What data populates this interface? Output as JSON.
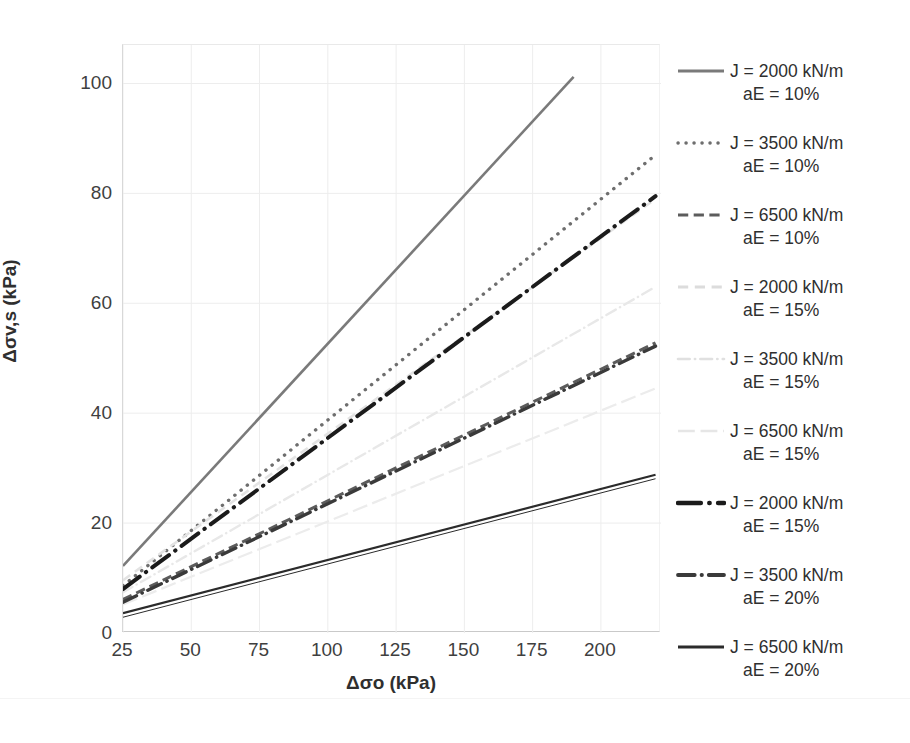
{
  "chart_data": {
    "type": "line",
    "title": "",
    "xlabel": "Δσo (kPa)",
    "ylabel": "Δσv,s (kPa)",
    "xlim": [
      25,
      222
    ],
    "ylim": [
      0,
      107
    ],
    "xticks": [
      25,
      50,
      75,
      100,
      125,
      150,
      175,
      200
    ],
    "yticks": [
      0,
      20,
      40,
      60,
      80,
      100
    ],
    "grid": true,
    "legend_position": "right",
    "series": [
      {
        "name": "J = 2000 kN/m aE = 10%",
        "J": 2000,
        "aE": "10%",
        "style": "solid",
        "color": "#7a7a7a",
        "width": 2.6,
        "x": [
          25,
          190
        ],
        "y": [
          12.2,
          101.2
        ]
      },
      {
        "name": "J = 3500 kN/m aE = 10%",
        "J": 3500,
        "aE": "10%",
        "style": "dotted",
        "color": "#6e6e6e",
        "width": 3.4,
        "x": [
          25,
          220
        ],
        "y": [
          8.6,
          87.0
        ]
      },
      {
        "name": "J = 6500 kN/m aE = 10%",
        "J": 6500,
        "aE": "10%",
        "style": "dashed",
        "color": "#5c5c5c",
        "width": 3.0,
        "x": [
          25,
          220
        ],
        "y": [
          6.1,
          52.8
        ]
      },
      {
        "name": "J = 2000 kN/m aE = 15%",
        "J": 2000,
        "aE": "15%",
        "style": "dashed-light",
        "color": "#e3e3e3",
        "width": 2.6,
        "x": [
          25,
          220
        ],
        "y": [
          9.6,
          79.0
        ]
      },
      {
        "name": "J = 3500 kN/m aE = 15%",
        "J": 3500,
        "aE": "15%",
        "style": "dash-dot-light",
        "color": "#e8e8e8",
        "width": 2.4,
        "x": [
          25,
          220
        ],
        "y": [
          7.4,
          63.0
        ]
      },
      {
        "name": "J = 6500 kN/m aE = 15%",
        "J": 6500,
        "aE": "15%",
        "style": "long-dash-light",
        "color": "#ececec",
        "width": 2.2,
        "x": [
          25,
          220
        ],
        "y": [
          5.2,
          44.5
        ]
      },
      {
        "name": "J = 2000 kN/m aE = 15%",
        "J": 2000,
        "aE": "15%",
        "style": "dash-dot-bold",
        "color": "#1b1b1b",
        "width": 4.0,
        "x": [
          25,
          220
        ],
        "y": [
          8.0,
          79.5
        ]
      },
      {
        "name": "J = 3500 kN/m aE = 20%",
        "J": 3500,
        "aE": "20%",
        "style": "dash-dot-mid",
        "color": "#3a3a3a",
        "width": 3.4,
        "x": [
          25,
          220
        ],
        "y": [
          5.6,
          52.2
        ]
      },
      {
        "name": "J = 6500 kN/m aE = 20%",
        "J": 6500,
        "aE": "20%",
        "style": "solid-dark",
        "color": "#2b2b2b",
        "width": 2.2,
        "x": [
          25,
          220
        ],
        "y": [
          3.6,
          28.8
        ]
      }
    ]
  },
  "axes": {
    "y_title": "Δσv,s (kPa)",
    "x_title": "Δσo (kPa)",
    "y_tick_labels": [
      "100",
      "80",
      "60",
      "40",
      "20",
      "0"
    ],
    "x_tick_labels": [
      "25",
      "50",
      "75",
      "100",
      "125",
      "150",
      "175",
      "200"
    ]
  },
  "legend": {
    "entries": [
      {
        "line1": "J = 2000 kN/m",
        "line2": "aE = 10%",
        "swatch": "solid-gray-line-icon"
      },
      {
        "line1": "J = 3500 kN/m",
        "line2": "aE = 10%",
        "swatch": "dotted-gray-line-icon"
      },
      {
        "line1": "J = 6500 kN/m",
        "line2": "aE = 10%",
        "swatch": "dashed-gray-line-icon"
      },
      {
        "line1": "J = 2000 kN/m",
        "line2": "aE = 15%",
        "swatch": "dashed-light-line-icon"
      },
      {
        "line1": "J = 3500 kN/m",
        "line2": "aE = 15%",
        "swatch": "dash-dot-light-line-icon"
      },
      {
        "line1": "J = 6500 kN/m",
        "line2": "aE = 15%",
        "swatch": "long-dash-light-line-icon"
      },
      {
        "line1": "J = 2000 kN/m",
        "line2": "aE = 15%",
        "swatch": "dash-dot-black-line-icon"
      },
      {
        "line1": "J = 3500 kN/m",
        "line2": "aE = 20%",
        "swatch": "dash-dot-dark-line-icon"
      },
      {
        "line1": "J = 6500 kN/m",
        "line2": "aE = 20%",
        "swatch": "solid-dark-line-icon"
      }
    ]
  },
  "caption": {
    "text": ""
  }
}
